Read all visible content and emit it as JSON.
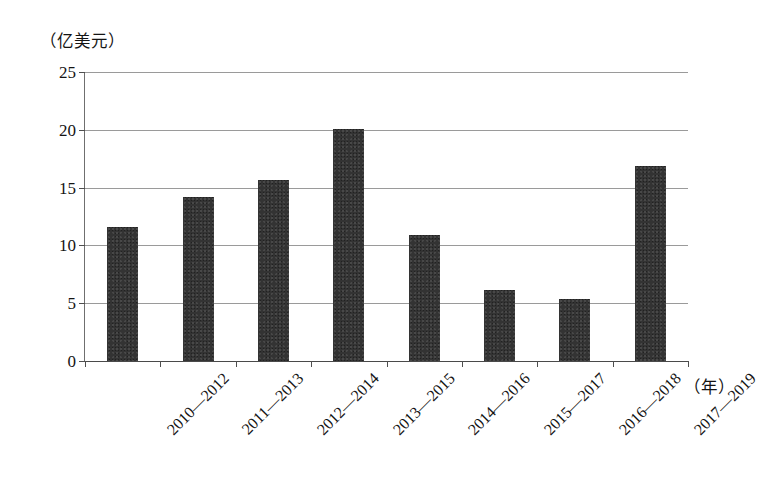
{
  "chart_data": {
    "type": "bar",
    "title": "",
    "subtitle": "",
    "xlabel": "（年）",
    "ylabel": "（亿美元）",
    "categories": [
      "2010—2012",
      "2011—2013",
      "2012—2014",
      "2013—2015",
      "2014—2016",
      "2015—2017",
      "2016—2018",
      "2017—2019"
    ],
    "values": [
      11.6,
      14.2,
      15.7,
      20.1,
      10.9,
      6.1,
      5.4,
      16.9
    ],
    "ylim": [
      0,
      25
    ],
    "ytick_labels": [
      "0",
      "5",
      "10",
      "15",
      "20",
      "25"
    ],
    "ytick_values": [
      0,
      5,
      10,
      15,
      20,
      25
    ],
    "grid": true,
    "legend": "none",
    "bar_color": "#333333",
    "grid_color": "#9a9a9a",
    "axis_color": "#4a4a4a",
    "background": "#ffffff",
    "xtick_label_rotation": -45
  }
}
